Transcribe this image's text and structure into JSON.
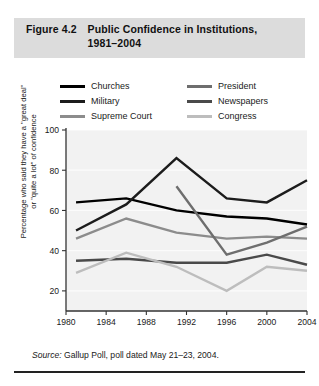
{
  "figure": {
    "number": "Figure 4.2",
    "title_line1": "Public Confidence in Institutions,",
    "title_line2": "1981–2004",
    "title_band_color": "#dcdcdc"
  },
  "source": {
    "prefix": "Source:",
    "text": "Gallup Poll, poll dated May 21–23, 2004."
  },
  "legend": {
    "left_column": [
      {
        "label": "Churches",
        "color": "#000000"
      },
      {
        "label": "Military",
        "color": "#1c1c1c"
      },
      {
        "label": "Supreme Court",
        "color": "#8c8c8c"
      }
    ],
    "right_column": [
      {
        "label": "President",
        "color": "#6e6e6e"
      },
      {
        "label": "Newspapers",
        "color": "#4a4a4a"
      },
      {
        "label": "Congress",
        "color": "#bdbdbd"
      }
    ]
  },
  "chart_data": {
    "type": "line",
    "title": "Public Confidence in Institutions, 1981–2004",
    "xlabel": "",
    "ylabel": "Percentage who said they have a \"great deal\" or \"quite a lot\" of confidence",
    "ylabel_lines": [
      "Percentage who said they have a \"great deal\"",
      "or \"quite a lot\" of confidence"
    ],
    "xlim": [
      1980,
      2004
    ],
    "ylim": [
      10,
      100
    ],
    "yticks": [
      20,
      40,
      60,
      80,
      100
    ],
    "xticks": [
      1980,
      1984,
      1988,
      1992,
      1996,
      2000,
      2004
    ],
    "grid": false,
    "plot_background": "#f2f2f2",
    "legend_position": "above-plot",
    "series": [
      {
        "name": "Churches",
        "color": "#000000",
        "width": 2.4,
        "x": [
          1981,
          1986,
          1991,
          1996,
          2000,
          2004
        ],
        "y": [
          64,
          66,
          60,
          57,
          56,
          53
        ]
      },
      {
        "name": "Military",
        "color": "#1c1c1c",
        "width": 2.4,
        "x": [
          1981,
          1986,
          1991,
          1996,
          2000,
          2004
        ],
        "y": [
          50,
          63,
          86,
          66,
          64,
          75
        ]
      },
      {
        "name": "Supreme Court",
        "color": "#8c8c8c",
        "width": 2.4,
        "x": [
          1981,
          1986,
          1991,
          1996,
          2000,
          2004
        ],
        "y": [
          46,
          56,
          49,
          46,
          47,
          46
        ]
      },
      {
        "name": "President",
        "color": "#6e6e6e",
        "width": 2.4,
        "x": [
          1991,
          1996,
          2000,
          2004
        ],
        "y": [
          72,
          38,
          44,
          52
        ]
      },
      {
        "name": "Newspapers",
        "color": "#4a4a4a",
        "width": 2.4,
        "x": [
          1981,
          1986,
          1991,
          1996,
          2000,
          2004
        ],
        "y": [
          35,
          36,
          34,
          34,
          38,
          33
        ]
      },
      {
        "name": "Congress",
        "color": "#bdbdbd",
        "width": 2.4,
        "x": [
          1981,
          1986,
          1991,
          1996,
          2000,
          2004
        ],
        "y": [
          29,
          39,
          32,
          20,
          32,
          30
        ]
      }
    ]
  }
}
